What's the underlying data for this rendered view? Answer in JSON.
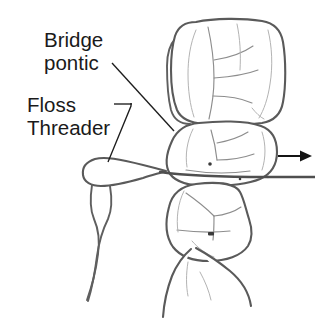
{
  "figure": {
    "background_color": "#ffffff",
    "outline_color": "#5a5a5a",
    "groove_color": "#8d8d8d",
    "label_color": "#1a1a1a",
    "arrow_color": "#141414",
    "width": 315,
    "height": 329
  },
  "labels": {
    "bridge_pontic_line1": "Bridge",
    "bridge_pontic_line2": "pontic",
    "floss_threader_line1": "Floss",
    "floss_threader_line2": "Threader"
  },
  "annotations": {
    "bridge_pontic_leader": "leader-line-bridge-pontic",
    "floss_threader_leader": "leader-line-floss-threader",
    "direction_arrow": "arrow-pointing-right"
  },
  "parts": {
    "upper_molar": "upper-molar-crown",
    "pontic": "bridge-pontic-tooth",
    "lower_molar": "lower-molar-tooth",
    "root": "tooth-root",
    "threader_loop": "floss-threader-loop",
    "threader_tail": "floss-threader-tail",
    "floss_strand": "floss-strand"
  }
}
